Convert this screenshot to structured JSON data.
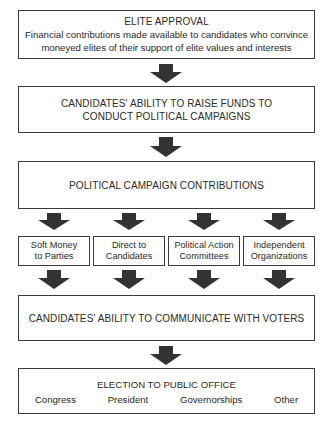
{
  "diagram": {
    "box_elite": {
      "title": "ELITE APPROVAL",
      "line1": "Financial contributions made available to candidates who convince",
      "line2": "moneyed elites of their support of elite values and interests"
    },
    "box_raise_funds": {
      "line1": "CANDIDATES' ABILITY TO RAISE FUNDS TO",
      "line2": "CONDUCT POLITICAL CAMPAIGNS"
    },
    "box_contributions": {
      "label": "POLITICAL CAMPAIGN CONTRIBUTIONS"
    },
    "channels": [
      {
        "line1": "Soft Money",
        "line2": "to Parties"
      },
      {
        "line1": "Direct to",
        "line2": "Candidates"
      },
      {
        "line1": "Political Action",
        "line2": "Committees"
      },
      {
        "line1": "Independent",
        "line2": "Organizations"
      }
    ],
    "box_communicate": {
      "label": "CANDIDATES' ABILITY TO COMMUNICATE WITH VOTERS"
    },
    "box_election": {
      "title": "ELECTION TO PUBLIC OFFICE",
      "offices": [
        "Congress",
        "President",
        "Governorships",
        "Other"
      ]
    },
    "colors": {
      "arrow": "#333333",
      "border": "#3a3a3a",
      "text": "#2a2a2a"
    }
  }
}
